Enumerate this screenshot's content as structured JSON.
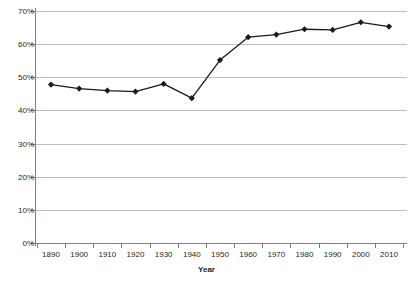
{
  "chart_data": {
    "type": "line",
    "title": "",
    "xlabel": "Year",
    "ylabel": "",
    "x": [
      1890,
      1900,
      1910,
      1920,
      1930,
      1940,
      1950,
      1960,
      1970,
      1980,
      1990,
      2000,
      2010
    ],
    "categories": [
      "1890",
      "1900",
      "1910",
      "1920",
      "1930",
      "1940",
      "1950",
      "1960",
      "1970",
      "1980",
      "1990",
      "2000",
      "2010"
    ],
    "values": [
      47.8,
      46.6,
      46.0,
      45.7,
      48.0,
      43.7,
      55.2,
      62.1,
      62.9,
      64.5,
      64.3,
      66.6,
      65.3
    ],
    "series": [
      {
        "name": "series-1",
        "values": [
          47.8,
          46.6,
          46.0,
          45.7,
          48.0,
          43.7,
          55.2,
          62.1,
          62.9,
          64.5,
          64.3,
          66.6,
          65.3
        ]
      }
    ],
    "ylim": [
      0,
      70
    ],
    "xlim": [
      1890,
      2010
    ],
    "y_ticks": [
      0,
      10,
      20,
      30,
      40,
      50,
      60,
      70
    ],
    "y_tick_labels": [
      "0%",
      "10%",
      "20%",
      "30%",
      "40%",
      "50%",
      "60%",
      "70%"
    ],
    "x_tick_labels": [
      "1890",
      "1900",
      "1910",
      "1920",
      "1930",
      "1940",
      "1950",
      "1960",
      "1970",
      "1980",
      "1990",
      "2000",
      "2010"
    ],
    "grid": "horizontal",
    "legend": "none",
    "marker": "diamond",
    "colors": {
      "series": "#1a1a1a",
      "grid": "#bfbfbf",
      "axis": "#7f7f7f",
      "text": "#231f20",
      "background": "#ffffff"
    }
  }
}
